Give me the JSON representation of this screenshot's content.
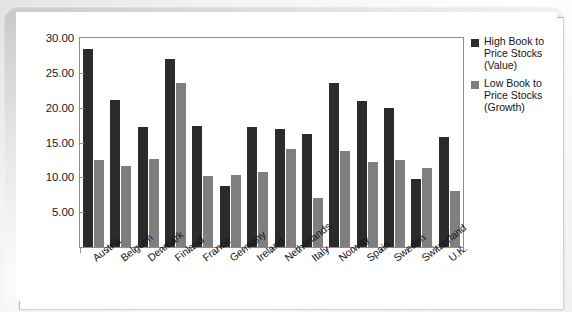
{
  "chart_data": {
    "type": "bar",
    "title": "",
    "subtitle": "",
    "xlabel": "",
    "ylabel": "",
    "ylim": [
      0,
      30
    ],
    "ytick_step": 5,
    "ytick_labels": [
      "30.00",
      "25.00",
      "20.00",
      "15.00",
      "10.00",
      "5.00"
    ],
    "ytick_values": [
      30,
      25,
      20,
      15,
      10,
      5
    ],
    "grid": false,
    "legend_position": "right",
    "categories": [
      "Austria",
      "Belguim",
      "Denmark",
      "Finland",
      "France",
      "Germany",
      "Ireland",
      "Netherlands",
      "Italy",
      "Norway",
      "Spain",
      "Sweden",
      "Switzerland",
      "U.K."
    ],
    "series": [
      {
        "name": "High Book to Price Stocks (Value)",
        "color": "#2b2b2b",
        "values": [
          28.4,
          21.1,
          17.2,
          27.0,
          17.3,
          8.8,
          17.2,
          16.9,
          16.2,
          23.5,
          21.0,
          20.0,
          9.8,
          15.8
        ]
      },
      {
        "name": "Low Book to Price Stocks (Growth)",
        "color": "#7f7f7f",
        "values": [
          12.5,
          11.7,
          12.6,
          23.5,
          10.2,
          10.3,
          10.8,
          14.0,
          7.1,
          13.8,
          12.2,
          12.5,
          11.3,
          8.1
        ]
      }
    ],
    "legend": [
      {
        "swatch": "high",
        "lines": [
          "High Book to",
          "Price Stocks",
          "(Value)"
        ]
      },
      {
        "swatch": "low",
        "lines": [
          "Low Book to",
          "Price Stocks",
          "(Growth)"
        ]
      }
    ],
    "colors": {
      "high_series": "#2b2b2b",
      "low_series": "#7f7f7f",
      "axis": "#8d8d8d",
      "text": "#141414",
      "plot_background": "#ffffff"
    }
  }
}
